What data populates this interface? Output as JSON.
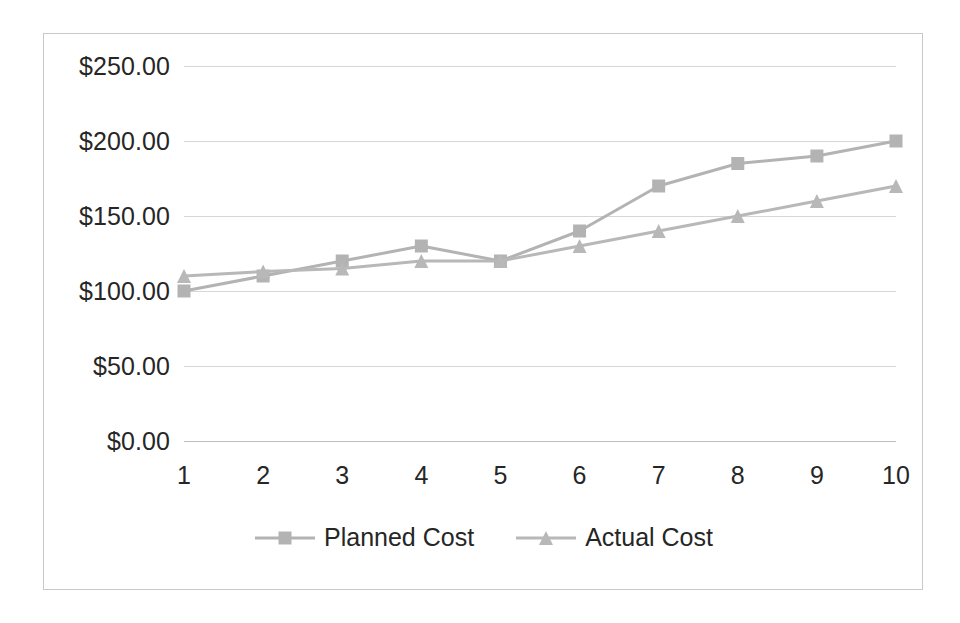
{
  "chart_data": {
    "type": "line",
    "title": "",
    "xlabel": "",
    "ylabel": "",
    "x": [
      1,
      2,
      3,
      4,
      5,
      6,
      7,
      8,
      9,
      10
    ],
    "categories": [
      "1",
      "2",
      "3",
      "4",
      "5",
      "6",
      "7",
      "8",
      "9",
      "10"
    ],
    "x_tick_labels": [
      "1",
      "2",
      "3",
      "4",
      "5",
      "6",
      "7",
      "8",
      "9",
      "10"
    ],
    "y_tick_labels": [
      "$0.00",
      "$50.00",
      "$100.00",
      "$150.00",
      "$200.00",
      "$250.00"
    ],
    "y_tick_values": [
      0,
      50,
      100,
      150,
      200,
      250
    ],
    "ylim": [
      0,
      250
    ],
    "xlim": [
      1,
      10
    ],
    "grid": "horizontal",
    "legend_position": "bottom",
    "series": [
      {
        "name": "Planned Cost",
        "marker": "square",
        "color": "#b3b3b3",
        "values": [
          100,
          110,
          120,
          130,
          120,
          140,
          170,
          185,
          190,
          200
        ]
      },
      {
        "name": "Actual Cost",
        "marker": "triangle",
        "color": "#b8b8b8",
        "values": [
          110,
          113,
          115,
          120,
          120,
          130,
          140,
          150,
          160,
          170
        ]
      }
    ]
  },
  "legend": {
    "entries": [
      {
        "label": "Planned Cost",
        "marker": "square-marker-icon"
      },
      {
        "label": "Actual Cost",
        "marker": "triangle-marker-icon"
      }
    ]
  },
  "colors": {
    "series_planned": "#b3b3b3",
    "series_actual": "#b8b8b8",
    "gridline": "#d6d6d6",
    "axis": "#bdbdbd",
    "border": "#c9c9c9",
    "text": "#262626",
    "background": "#ffffff"
  }
}
